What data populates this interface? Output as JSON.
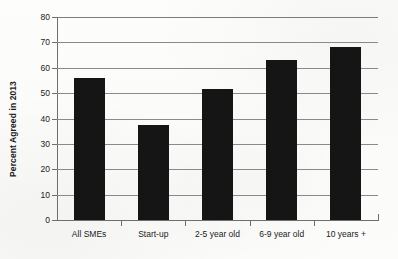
{
  "chart_data": {
    "type": "bar",
    "title": "",
    "xlabel": "",
    "ylabel": "Percent Agreed in 2013",
    "categories": [
      "All SMEs",
      "Start-up",
      "2-5 year old",
      "6-9 year old",
      "10 years +"
    ],
    "values": [
      56,
      37.5,
      51.5,
      63,
      68
    ],
    "ylim": [
      0,
      80
    ],
    "ytick_labels": [
      "80",
      "70",
      "60",
      "50",
      "40",
      "30",
      "20",
      "10",
      "0"
    ],
    "ytick_values": [
      80,
      70,
      60,
      50,
      40,
      30,
      20,
      10,
      0
    ],
    "ytick_step": 10,
    "grid": "horizontal",
    "legend": "none",
    "bar_color": "#151515",
    "gridline_color": "#8a8a8a",
    "axis_color": "#6e6e6e",
    "background_color": "#ffffff"
  }
}
